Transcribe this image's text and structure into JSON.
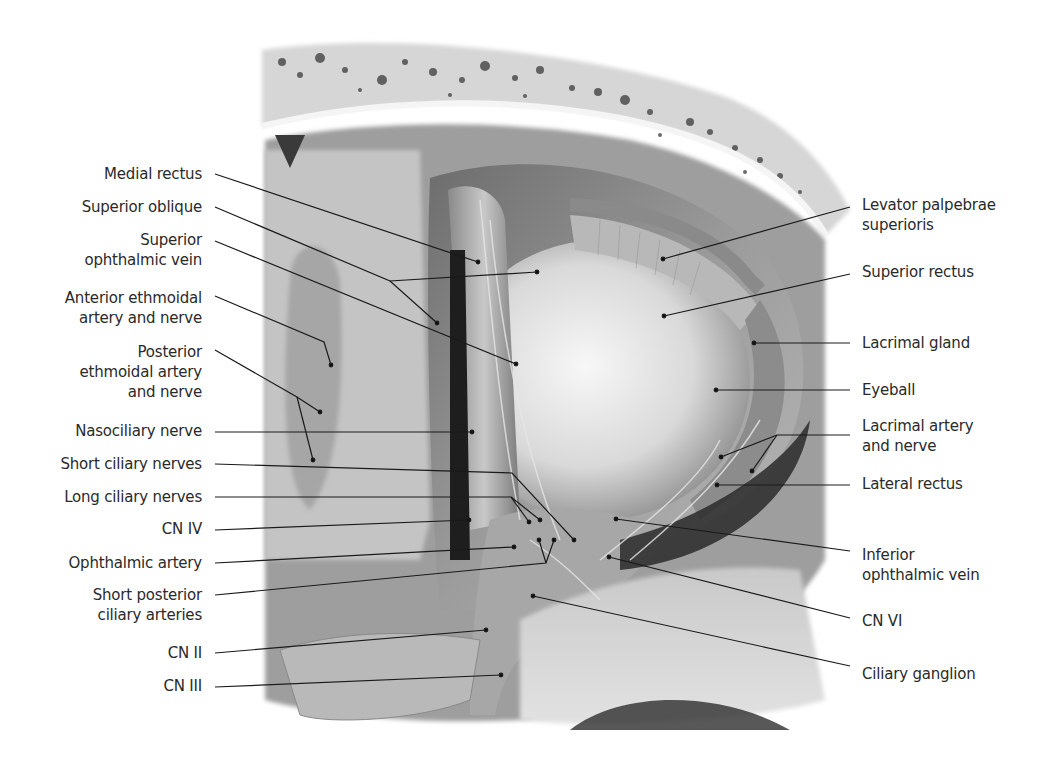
{
  "figure": {
    "colors": {
      "background": "#ffffff",
      "text": "#2a2a2a",
      "leader_line": "#1a1a1a",
      "bone": "#d8d8d8",
      "bone_pores": "#3a3a3a",
      "periorbita": "#9a9a9a",
      "eyeball": "#e4e4e4",
      "muscle": "#b5b5b5",
      "shadow": "#1e1e1e"
    }
  },
  "labels_left": [
    {
      "id": "medial-rectus",
      "text": "Medial rectus",
      "x": 202,
      "y": 164,
      "leader": [
        [
          215,
          174
        ],
        [
          478,
          262
        ]
      ]
    },
    {
      "id": "superior-oblique",
      "text": "Superior oblique",
      "x": 202,
      "y": 197,
      "leader": [
        [
          215,
          207
        ],
        [
          390,
          281
        ],
        [
          437,
          323
        ]
      ],
      "leader2": [
        [
          390,
          281
        ],
        [
          537,
          272
        ]
      ]
    },
    {
      "id": "superior-ophthalmic-vein",
      "text": "Superior\nophthalmic vein",
      "x": 202,
      "y": 230,
      "leader": [
        [
          215,
          241
        ],
        [
          516,
          364
        ]
      ]
    },
    {
      "id": "anterior-ethmoidal-artery-nerve",
      "text": "Anterior ethmoidal\nartery and nerve",
      "x": 202,
      "y": 288,
      "leader": [
        [
          215,
          296
        ],
        [
          324,
          342
        ],
        [
          331,
          365
        ]
      ]
    },
    {
      "id": "posterior-ethmoidal-artery-nerve",
      "text": "Posterior\nethmoidal artery\nand nerve",
      "x": 202,
      "y": 342,
      "leader": [
        [
          215,
          350
        ],
        [
          297,
          397
        ],
        [
          320,
          412
        ]
      ],
      "leader2": [
        [
          297,
          397
        ],
        [
          313,
          460
        ]
      ]
    },
    {
      "id": "nasociliary-nerve",
      "text": "Nasociliary nerve",
      "x": 202,
      "y": 421,
      "leader": [
        [
          215,
          432
        ],
        [
          472,
          432
        ]
      ]
    },
    {
      "id": "short-ciliary-nerves",
      "text": "Short ciliary nerves",
      "x": 202,
      "y": 454,
      "leader": [
        [
          215,
          464
        ],
        [
          512,
          473
        ],
        [
          574,
          540
        ]
      ]
    },
    {
      "id": "long-ciliary-nerves",
      "text": "Long ciliary nerves",
      "x": 202,
      "y": 487,
      "leader": [
        [
          215,
          497
        ],
        [
          511,
          497
        ],
        [
          529,
          522
        ]
      ],
      "leader2": [
        [
          511,
          497
        ],
        [
          540,
          520
        ]
      ]
    },
    {
      "id": "cn-iv",
      "text": "CN IV",
      "x": 202,
      "y": 519,
      "leader": [
        [
          215,
          530
        ],
        [
          469,
          520
        ]
      ]
    },
    {
      "id": "ophthalmic-artery",
      "text": "Ophthalmic artery",
      "x": 202,
      "y": 553,
      "leader": [
        [
          215,
          563
        ],
        [
          514,
          547
        ]
      ]
    },
    {
      "id": "short-posterior-ciliary-arteries",
      "text": "Short posterior\nciliary arteries",
      "x": 202,
      "y": 585,
      "leader": [
        [
          215,
          595
        ],
        [
          546,
          563
        ],
        [
          554,
          540
        ]
      ],
      "leader2": [
        [
          546,
          563
        ],
        [
          539,
          540
        ]
      ]
    },
    {
      "id": "cn-ii",
      "text": "CN II",
      "x": 202,
      "y": 643,
      "leader": [
        [
          215,
          653
        ],
        [
          486,
          630
        ]
      ]
    },
    {
      "id": "cn-iii",
      "text": "CN III",
      "x": 202,
      "y": 676,
      "leader": [
        [
          215,
          687
        ],
        [
          501,
          675
        ]
      ]
    }
  ],
  "labels_right": [
    {
      "id": "levator-palpebrae-superioris",
      "text": "Levator palpebrae\nsuperioris",
      "x": 862,
      "y": 195,
      "leader": [
        [
          850,
          207
        ],
        [
          663,
          259
        ]
      ]
    },
    {
      "id": "superior-rectus",
      "text": "Superior rectus",
      "x": 862,
      "y": 262,
      "leader": [
        [
          850,
          274
        ],
        [
          664,
          316
        ]
      ]
    },
    {
      "id": "lacrimal-gland",
      "text": "Lacrimal gland",
      "x": 862,
      "y": 333,
      "leader": [
        [
          850,
          343
        ],
        [
          754,
          343
        ]
      ]
    },
    {
      "id": "eyeball",
      "text": "Eyeball",
      "x": 862,
      "y": 380,
      "leader": [
        [
          850,
          390
        ],
        [
          716,
          390
        ]
      ]
    },
    {
      "id": "lacrimal-artery-nerve",
      "text": "Lacrimal artery\nand nerve",
      "x": 862,
      "y": 416,
      "leader": [
        [
          850,
          435
        ],
        [
          777,
          435
        ],
        [
          721,
          457
        ]
      ],
      "leader2": [
        [
          777,
          435
        ],
        [
          752,
          471
        ]
      ]
    },
    {
      "id": "lateral-rectus",
      "text": "Lateral rectus",
      "x": 862,
      "y": 474,
      "leader": [
        [
          850,
          485
        ],
        [
          717,
          485
        ]
      ]
    },
    {
      "id": "inferior-ophthalmic-vein",
      "text": "Inferior\nophthalmic vein",
      "x": 862,
      "y": 545,
      "leader": [
        [
          850,
          551
        ],
        [
          616,
          519
        ]
      ]
    },
    {
      "id": "cn-vi",
      "text": "CN VI",
      "x": 862,
      "y": 611,
      "leader": [
        [
          850,
          618
        ],
        [
          609,
          557
        ]
      ]
    },
    {
      "id": "ciliary-ganglion",
      "text": "Ciliary ganglion",
      "x": 862,
      "y": 664,
      "leader": [
        [
          850,
          666
        ],
        [
          533,
          596
        ]
      ]
    }
  ]
}
